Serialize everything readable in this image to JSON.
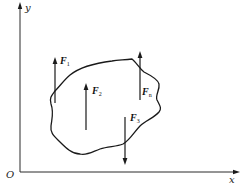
{
  "diagram": {
    "type": "free-body-diagram",
    "axes": {
      "origin_label": "O",
      "x_label": "x",
      "y_label": "y"
    },
    "forces": [
      {
        "id": "F1",
        "symbol": "F",
        "subscript": "1",
        "direction": "up"
      },
      {
        "id": "F2",
        "symbol": "F",
        "subscript": "2",
        "direction": "up"
      },
      {
        "id": "F3",
        "symbol": "F",
        "subscript": "3",
        "direction": "down"
      },
      {
        "id": "Fn",
        "symbol": "F",
        "subscript": "n",
        "direction": "up"
      }
    ],
    "colors": {
      "line": "#1a1a1a",
      "background": "#ffffff"
    }
  }
}
